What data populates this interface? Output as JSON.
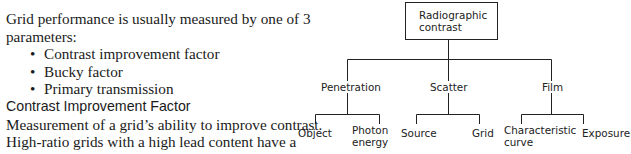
{
  "text": {
    "intro": "Grid performance is usually measured by one of 3 parameters:",
    "bullets": [
      "Contrast improvement factor",
      "Bucky factor",
      "Primary transmission"
    ],
    "subheading": "Contrast Improvement Factor",
    "body": "Measurement of a grid’s ability to improve contrast. High-ratio grids with a high lead content have a high contrast improvement"
  },
  "diagram": {
    "root": {
      "line1": "Radiographic",
      "line2": "contrast"
    },
    "branches": [
      {
        "label": "Penetration",
        "children": [
          {
            "line1": "Object",
            "line2": ""
          },
          {
            "line1": "Photon",
            "line2": "energy"
          }
        ]
      },
      {
        "label": "Scatter",
        "children": [
          {
            "line1": "Source",
            "line2": ""
          },
          {
            "line1": "Grid",
            "line2": ""
          }
        ]
      },
      {
        "label": "Film",
        "children": [
          {
            "line1": "Characteristic",
            "line2": "curve"
          },
          {
            "line1": "Exposure",
            "line2": ""
          }
        ]
      }
    ]
  }
}
